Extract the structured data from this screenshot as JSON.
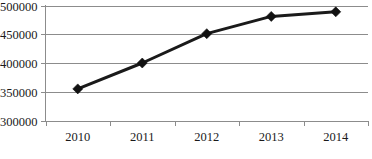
{
  "chart_data": {
    "type": "line",
    "title": "",
    "subtitle": "",
    "xlabel": "",
    "ylabel": "",
    "categories": [
      "2010",
      "2011",
      "2012",
      "2013",
      "2014"
    ],
    "values": [
      355000,
      400000,
      451000,
      481000,
      489000
    ],
    "series": [
      {
        "name": "",
        "values": [
          355000,
          400000,
          451000,
          481000,
          489000
        ]
      }
    ],
    "ylim": [
      300000,
      500000
    ],
    "ytick_values": [
      300000,
      350000,
      400000,
      450000,
      500000
    ],
    "ytick_labels": [
      "300000",
      "350000",
      "400000",
      "450000",
      "500000"
    ],
    "xtick_labels": [
      "2010",
      "2011",
      "2012",
      "2013",
      "2014"
    ],
    "grid": true,
    "grid_axis": "y",
    "legend": false,
    "legend_position": "none",
    "marker": "diamond",
    "annotations": []
  },
  "style": {
    "line_color": "#1a1a1a",
    "marker_color": "#111111",
    "grid_color": "#8c8c8c",
    "axis_color": "#8c8c8c",
    "text_color": "#1a1a1a",
    "background": "#ffffff"
  }
}
